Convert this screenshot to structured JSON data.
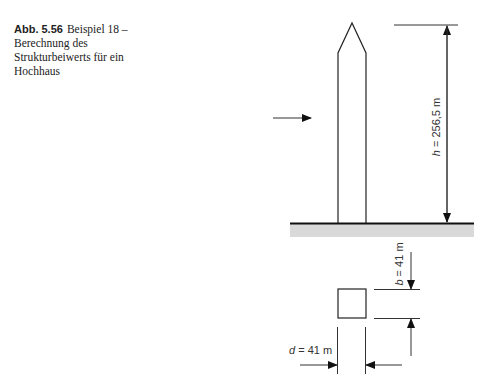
{
  "caption": {
    "figure_number": "Abb. 5.56",
    "text": "Beispiel 18 – Berechnung des Strukturbeiwerts für ein Hochhaus"
  },
  "figure": {
    "elevation": {
      "height_symbol": "h",
      "height_value": " = 256,5 m",
      "wind_arrow": "wind-load-arrow"
    },
    "plan": {
      "width_symbol": "b",
      "width_value": " = 41 m",
      "depth_symbol": "d",
      "depth_value": " = 41 m"
    },
    "colors": {
      "line": "#1a1a1a",
      "ground_fill": "#d9d9d9"
    }
  }
}
